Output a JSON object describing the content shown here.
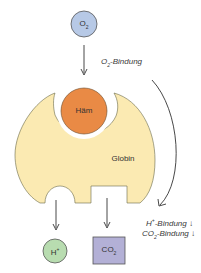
{
  "diagram": {
    "o2": {
      "label": "O",
      "sub": "2",
      "color": "#b7c9e6"
    },
    "o2_binding": {
      "prefix": "O",
      "sub": "2",
      "text": "-Bindung"
    },
    "haem": {
      "label": "Häm",
      "color": "#e98a45"
    },
    "globin": {
      "label": "Globin",
      "color": "#fbeab2"
    },
    "h_plus": {
      "label": "H",
      "sup": "+",
      "color": "#b8dcb0"
    },
    "co2": {
      "label": "CO",
      "sub": "2",
      "color": "#b3b0d6"
    },
    "h_binding": {
      "prefix": "H",
      "sup": "+",
      "text": "-Bindung ↓"
    },
    "co2_binding": {
      "prefix": "CO",
      "sub": "2",
      "text": "-Bindung ↓"
    }
  }
}
